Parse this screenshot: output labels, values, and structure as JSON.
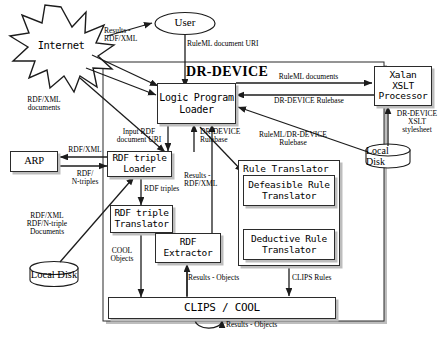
{
  "diagram": {
    "title": "DR-DEVICE",
    "external_nodes": {
      "internet": "Internet",
      "user": "User",
      "arp": "ARP",
      "xalan": "Xalan\nXSLT\nProcessor",
      "local_disk_right": "Local Disk",
      "local_disk_left": "Local Disk"
    },
    "components": {
      "logic_program_loader": "Logic Program\nLoader",
      "rdf_triple_loader": "RDF triple\nLoader",
      "rdf_triple_translator": "RDF triple\nTranslator",
      "rdf_extractor": "RDF\nExtractor",
      "rule_translator": "Rule Translator",
      "defeasible_rule_translator": "Defeasible Rule\nTranslator",
      "deductive_rule_translator": "Deductive Rule\nTranslator",
      "clips_cool": "CLIPS / COOL"
    },
    "edge_labels": {
      "results_rdfxml_user": "Results -\nRDF/XML",
      "ruleml_document_uri": "RuleML document URI",
      "ruleml_documents": "RuleML documents",
      "dr_device_rulebase_top": "DR-DEVICE Rulebase",
      "dr_device_xslt_stylesheet": "DR-DEVICE\nXSLT\nstylesheet",
      "rdfxml_documents": "RDF/XML\ndocuments",
      "input_rdf_document_uri": "Input RDF\ndocument URI",
      "dr_device_rulebase_mid": "DR-DEVICE\nRulebase",
      "ruleml_dr_device_rulebase": "RuleML/DR-DEVICE\nRulebase",
      "rdfxml_arp": "RDF/XML",
      "rdf_ntriples": "RDF/\nN-triples",
      "rdf_triples": "RDF triples",
      "results_rdfxml_mid": "Results -\nRDF/XML",
      "rdfxml_ntriple_documents": "RDF/XML\nRDF/N-triple\nDocuments",
      "cool_objects": "COOL\nObjects",
      "results_objects_extractor": "Results - Objects",
      "clips_rules": "CLIPS Rules",
      "results_objects_loop": "Results - Objects"
    }
  }
}
